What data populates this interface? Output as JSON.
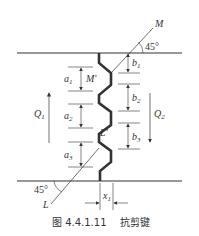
{
  "figure": {
    "caption_number": "图 4.4.1.11",
    "caption_title": "抗剪键"
  },
  "labels": {
    "M": "M",
    "M_prime": "M'",
    "L": "L",
    "L_prime": "L'",
    "angle_top": "45°",
    "angle_bottom": "45°",
    "Q1": "Q",
    "Q1_sub": "1",
    "Q2": "Q",
    "Q2_sub": "2",
    "a1": "a",
    "a1_sub": "1",
    "a2": "a",
    "a2_sub": "2",
    "a3": "a",
    "a3_sub": "3",
    "b1": "b",
    "b1_sub": "1",
    "b2": "b",
    "b2_sub": "2",
    "b3": "b",
    "b3_sub": "3",
    "x1": "x",
    "x1_sub": "1"
  },
  "colors": {
    "line": "#333333",
    "background": "#ffffff"
  }
}
